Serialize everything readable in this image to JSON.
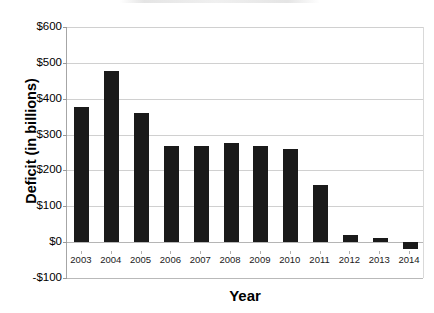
{
  "chart_data": {
    "type": "bar",
    "title": "",
    "xlabel": "Year",
    "ylabel": "Deficit (in billions)",
    "categories": [
      "2003",
      "2004",
      "2005",
      "2006",
      "2007",
      "2008",
      "2009",
      "2010",
      "2011",
      "2012",
      "2013",
      "2014"
    ],
    "values": [
      377,
      476,
      361,
      269,
      267,
      277,
      269,
      259,
      160,
      21,
      11,
      -18
    ],
    "series": [
      {
        "name": "Deficit",
        "values": [
          377,
          476,
          361,
          269,
          267,
          277,
          269,
          259,
          160,
          21,
          11,
          -18
        ]
      }
    ],
    "ylim": [
      -100,
      600
    ],
    "ytick_values": [
      600,
      500,
      400,
      300,
      200,
      100,
      0,
      -100
    ],
    "ytick_labels": [
      "$600",
      "$500",
      "$400",
      "$300",
      "$200",
      "$100",
      "$0",
      "-$100"
    ],
    "grid": true,
    "legend": false,
    "bar_color": "#1a1a1a",
    "gridline_color": "#d0d0d0",
    "axis_color": "#a6a6a6"
  }
}
